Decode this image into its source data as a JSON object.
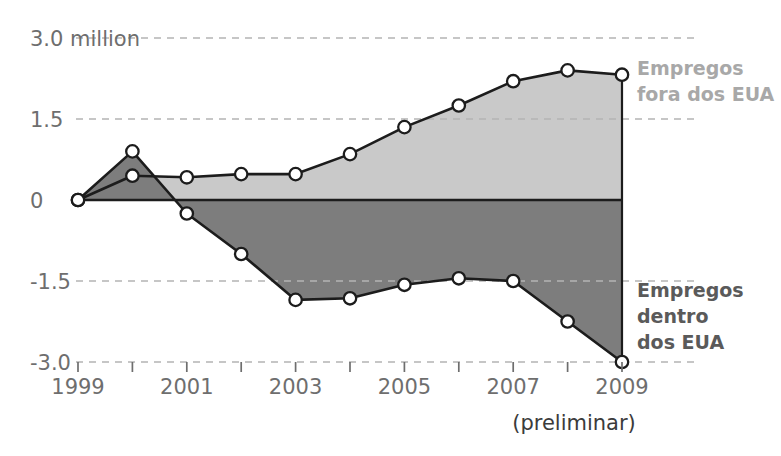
{
  "chart_data": {
    "type": "area",
    "title": "",
    "subtitle": "",
    "xlabel": "",
    "ylabel": "",
    "note": "(preliminar)",
    "unit_label": "3.0 million",
    "grid": true,
    "legend_position": "right",
    "x": [
      1999,
      2000,
      2001,
      2002,
      2003,
      2004,
      2005,
      2006,
      2007,
      2008,
      2009
    ],
    "xtick_labels": [
      "1999",
      "",
      "2001",
      "",
      "2003",
      "",
      "2005",
      "",
      "2007",
      "",
      "2009"
    ],
    "xlim": [
      1999,
      2009
    ],
    "ylim": [
      -3.0,
      3.0
    ],
    "ytick_values": [
      3.0,
      1.5,
      0,
      -1.5,
      -3.0
    ],
    "ytick_labels": [
      "3.0 million",
      "1.5",
      "0",
      "-1.5",
      "-3.0"
    ],
    "series": [
      {
        "name": "Empregos fora dos EUA",
        "label_lines": [
          "Empregos",
          "fora dos EUA"
        ],
        "color": "#c9c9c9",
        "values": [
          0.0,
          0.45,
          0.42,
          0.48,
          0.48,
          0.85,
          1.35,
          1.75,
          2.2,
          2.4,
          2.32
        ]
      },
      {
        "name": "Empregos dentro dos EUA",
        "label_lines": [
          "Empregos",
          "dentro",
          "dos EUA"
        ],
        "color": "#7d7d7d",
        "values": [
          0.0,
          0.9,
          -0.25,
          -1.0,
          -1.85,
          -1.82,
          -1.57,
          -1.45,
          -1.5,
          -2.25,
          -3.0
        ]
      }
    ]
  },
  "axis": {
    "y_label_color": "#6e6e6e",
    "x_label_color": "#6e6e6e",
    "grid_color": "#b4b4b4",
    "zero_line_color": "#1c1c1c"
  },
  "legend": {
    "outside_label": "Empregos fora dos EUA",
    "inside_label": "Empregos dentro dos EUA"
  }
}
